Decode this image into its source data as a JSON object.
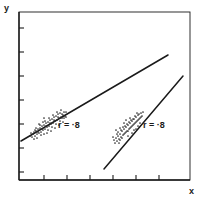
{
  "figure": {
    "background_color": "#ffffff",
    "ink_color": "#1a1a1a",
    "dot_color": "#2a2a2a"
  },
  "axes": {
    "y_label": "y",
    "x_label": "x",
    "frame": {
      "left": 19,
      "top": 12,
      "right": 190,
      "bottom": 180
    },
    "y_ticks": [
      28,
      52,
      76,
      100,
      124,
      148,
      172
    ],
    "x_ticks": [
      44,
      67,
      90,
      113,
      136,
      159
    ],
    "tick_length": 5,
    "grid": false
  },
  "annotations": [
    {
      "text": "r = ·8",
      "x": 58,
      "y": 128
    },
    {
      "text": "r = ·8",
      "x": 143,
      "y": 128
    }
  ],
  "chart_data": {
    "type": "scatter",
    "title": "",
    "xlabel": "x",
    "ylabel": "y",
    "grid": false,
    "legend": null,
    "axis_ranges": {
      "x": [
        19,
        190
      ],
      "y": [
        12,
        180
      ]
    },
    "annotations": [
      {
        "text": "r = ·8",
        "series": "group-1",
        "value": 0.8
      },
      {
        "text": "r = ·8",
        "series": "group-2",
        "value": 0.8
      }
    ],
    "series": [
      {
        "name": "group-1",
        "correlation": 0.8,
        "regression_line": {
          "x1": 21,
          "y1": 141,
          "x2": 168,
          "y2": 55
        },
        "points": [
          [
            32,
            137
          ],
          [
            35,
            136
          ],
          [
            34,
            132
          ],
          [
            37,
            134
          ],
          [
            36,
            131
          ],
          [
            39,
            133
          ],
          [
            38,
            129
          ],
          [
            41,
            132
          ],
          [
            40,
            128
          ],
          [
            43,
            130
          ],
          [
            42,
            126
          ],
          [
            45,
            129
          ],
          [
            44,
            125
          ],
          [
            47,
            127
          ],
          [
            46,
            123
          ],
          [
            49,
            126
          ],
          [
            48,
            122
          ],
          [
            51,
            124
          ],
          [
            50,
            120
          ],
          [
            53,
            123
          ],
          [
            52,
            119
          ],
          [
            55,
            121
          ],
          [
            54,
            117
          ],
          [
            57,
            120
          ],
          [
            56,
            116
          ],
          [
            59,
            118
          ],
          [
            58,
            114
          ],
          [
            61,
            117
          ],
          [
            60,
            113
          ],
          [
            63,
            115
          ],
          [
            33,
            134
          ],
          [
            38,
            132
          ],
          [
            42,
            129
          ],
          [
            46,
            126
          ],
          [
            50,
            123
          ],
          [
            54,
            120
          ],
          [
            58,
            117
          ],
          [
            62,
            114
          ],
          [
            36,
            128
          ],
          [
            40,
            125
          ],
          [
            44,
            134
          ],
          [
            48,
            130
          ],
          [
            52,
            127
          ],
          [
            56,
            124
          ],
          [
            60,
            121
          ],
          [
            64,
            118
          ],
          [
            37,
            138
          ],
          [
            41,
            135
          ],
          [
            45,
            121
          ],
          [
            49,
            118
          ],
          [
            53,
            115
          ],
          [
            57,
            112
          ],
          [
            61,
            110
          ],
          [
            39,
            124
          ],
          [
            43,
            122
          ],
          [
            47,
            133
          ],
          [
            51,
            131
          ],
          [
            55,
            128
          ],
          [
            59,
            125
          ],
          [
            63,
            122
          ],
          [
            65,
            116
          ],
          [
            66,
            112
          ],
          [
            34,
            139
          ],
          [
            31,
            133
          ],
          [
            30,
            136
          ],
          [
            62,
            118
          ],
          [
            64,
            112
          ],
          [
            66,
            117
          ],
          [
            35,
            130
          ],
          [
            44,
            118
          ]
        ]
      },
      {
        "name": "group-2",
        "correlation": 0.8,
        "regression_line": {
          "x1": 104,
          "y1": 169,
          "x2": 183,
          "y2": 76
        },
        "points": [
          [
            117,
            141
          ],
          [
            119,
            139
          ],
          [
            118,
            136
          ],
          [
            121,
            137
          ],
          [
            120,
            134
          ],
          [
            123,
            135
          ],
          [
            122,
            131
          ],
          [
            125,
            133
          ],
          [
            124,
            129
          ],
          [
            127,
            131
          ],
          [
            126,
            127
          ],
          [
            129,
            129
          ],
          [
            128,
            125
          ],
          [
            131,
            127
          ],
          [
            130,
            123
          ],
          [
            133,
            125
          ],
          [
            132,
            121
          ],
          [
            135,
            123
          ],
          [
            134,
            119
          ],
          [
            137,
            121
          ],
          [
            136,
            117
          ],
          [
            139,
            119
          ],
          [
            138,
            115
          ],
          [
            141,
            117
          ],
          [
            116,
            138
          ],
          [
            118,
            132
          ],
          [
            121,
            130
          ],
          [
            124,
            134
          ],
          [
            127,
            124
          ],
          [
            130,
            128
          ],
          [
            133,
            119
          ],
          [
            136,
            122
          ],
          [
            139,
            114
          ],
          [
            115,
            143
          ],
          [
            117,
            134
          ],
          [
            120,
            140
          ],
          [
            123,
            127
          ],
          [
            126,
            132
          ],
          [
            129,
            122
          ],
          [
            132,
            126
          ],
          [
            135,
            116
          ],
          [
            138,
            120
          ],
          [
            141,
            113
          ],
          [
            119,
            143
          ],
          [
            122,
            138
          ],
          [
            125,
            126
          ],
          [
            128,
            131
          ],
          [
            131,
            120
          ],
          [
            134,
            124
          ],
          [
            137,
            113
          ],
          [
            140,
            118
          ],
          [
            114,
            140
          ],
          [
            116,
            130
          ],
          [
            126,
            120
          ],
          [
            130,
            118
          ],
          [
            134,
            130
          ],
          [
            138,
            126
          ],
          [
            142,
            116
          ],
          [
            143,
            112
          ],
          [
            120,
            128
          ],
          [
            124,
            123
          ],
          [
            128,
            136
          ],
          [
            132,
            133
          ],
          [
            136,
            129
          ],
          [
            140,
            123
          ],
          [
            113,
            137
          ]
        ]
      }
    ]
  }
}
